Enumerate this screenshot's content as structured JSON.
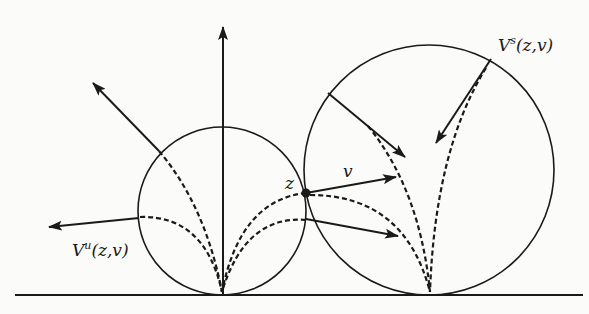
{
  "figure": {
    "width": 589,
    "height": 314,
    "ink_color": "#1a1a1a",
    "background": "#fbfbf9"
  },
  "labels": {
    "unstable": {
      "base": "V",
      "sup": "u",
      "args": "(z,v)",
      "x": 72,
      "y": 242
    },
    "stable": {
      "base": "V",
      "sup": "s",
      "args": "(z,v)",
      "x": 498,
      "y": 37
    },
    "point_z": {
      "text": "z",
      "x": 285,
      "y": 175
    },
    "vector_v": {
      "text": "v",
      "x": 343,
      "y": 163
    }
  },
  "geometry": {
    "ground_line": {
      "x1": 15,
      "y1": 295,
      "x2": 583,
      "y2": 295
    },
    "small_horocycle": {
      "cx": 222,
      "cy": 211,
      "r": 84
    },
    "large_horocycle": {
      "cx": 429,
      "cy": 170,
      "r": 125
    },
    "point_z": {
      "cx": 306,
      "cy": 193,
      "r": 4.5
    },
    "vertical_axis": {
      "x1": 223,
      "y1": 295,
      "x2": 223,
      "y2": 27
    }
  }
}
